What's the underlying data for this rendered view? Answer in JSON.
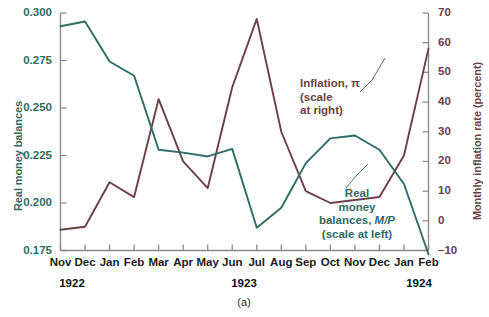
{
  "figure": {
    "caption": "(a)",
    "axis_left_title": "Real money balances",
    "axis_right_title": "Monthly inflation rate (percent)",
    "color_left": "#2d6b66",
    "color_right": "#6b4048"
  },
  "annotations": {
    "inflation": {
      "line1": "Inflation, π",
      "line2": "(scale",
      "line3": "at right)"
    },
    "real_money": {
      "line1": "Real",
      "line2": "money",
      "line3_a": "balances, ",
      "line3_b": "M/P",
      "line4": "(scale at left)"
    }
  },
  "years": [
    {
      "label": "1922",
      "x": 72
    },
    {
      "label": "1923",
      "x": 244
    },
    {
      "label": "1924",
      "x": 419
    }
  ],
  "chart_data": {
    "type": "line",
    "title": "",
    "xlabel": "",
    "ylabel": "Real money balances",
    "y2label": "Monthly inflation rate (percent)",
    "grid": false,
    "legend": "annotations-inline",
    "categories": [
      "Nov",
      "Dec",
      "Jan",
      "Feb",
      "Mar",
      "Apr",
      "May",
      "Jun",
      "Jul",
      "Aug",
      "Sep",
      "Oct",
      "Nov",
      "Dec",
      "Jan",
      "Feb"
    ],
    "x_year_groups": [
      "1922",
      "1922",
      "1923",
      "1923",
      "1923",
      "1923",
      "1923",
      "1923",
      "1923",
      "1923",
      "1923",
      "1923",
      "1923",
      "1923",
      "1924",
      "1924"
    ],
    "ylim": [
      0.175,
      0.3
    ],
    "yticks": [
      "0.175",
      "0.200",
      "0.225",
      "0.250",
      "0.275",
      "0.300"
    ],
    "y2lim": [
      -10,
      70
    ],
    "y2ticks": [
      "-10",
      "0",
      "10",
      "20",
      "30",
      "40",
      "50",
      "60",
      "70"
    ],
    "series": [
      {
        "name": "Real money balances, M/P",
        "axis": "left",
        "color": "#2d6b66",
        "values": [
          0.293,
          0.2955,
          0.2745,
          0.267,
          0.228,
          0.2265,
          0.2245,
          0.2285,
          0.187,
          0.1975,
          0.221,
          0.234,
          0.2355,
          0.228,
          0.21,
          0.173
        ]
      },
      {
        "name": "Inflation, π",
        "axis": "right",
        "color": "#6b4048",
        "values": [
          -3.0,
          -2.0,
          13.0,
          8.0,
          41.0,
          20.0,
          11.0,
          45.0,
          68.0,
          30.0,
          10.0,
          6.0,
          7.0,
          8.0,
          22.0,
          58.0
        ]
      }
    ]
  }
}
